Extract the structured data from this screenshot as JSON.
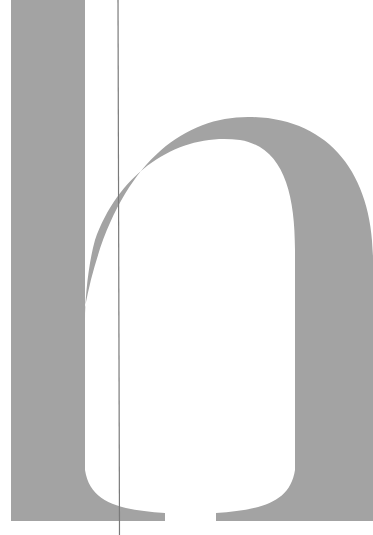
{
  "specimen": {
    "glyph": "h",
    "glyph_color": "#a3a3a3",
    "guide_line_color": "#7a7a7a",
    "background": "#ffffff"
  }
}
